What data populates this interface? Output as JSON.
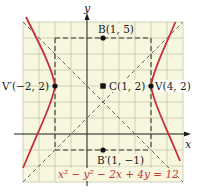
{
  "figure": {
    "equation": "x² − y² − 2x + 4y = 12",
    "axes": {
      "x_label": "x",
      "y_label": "y"
    },
    "grid": {
      "x_range": [
        -4,
        6
      ],
      "y_range": [
        -3,
        7
      ],
      "step": 1
    },
    "points": [
      {
        "name": "B",
        "label": "B(1, 5)",
        "x": 1,
        "y": 5,
        "marker": "dot"
      },
      {
        "name": "C",
        "label": "C(1, 2)",
        "x": 1,
        "y": 2,
        "marker": "square"
      },
      {
        "name": "V",
        "label": "V(4, 2)",
        "x": 4,
        "y": 2,
        "marker": "dot"
      },
      {
        "name": "V'",
        "label": "V′(−2, 2)",
        "x": -2,
        "y": 2,
        "marker": "dot"
      },
      {
        "name": "B'",
        "label": "B′(1, −1)",
        "x": 1,
        "y": -1,
        "marker": "dot"
      }
    ],
    "asymptotes": [
      "y − 2 = x − 1",
      "y − 2 = −(x − 1)"
    ],
    "colors": {
      "grid_bg": "#f7f6df",
      "grid_line": "#c8c9a8",
      "curve": "#c62f3a",
      "dashed": "#555555",
      "axis": "#1a1a1a",
      "equation": "#c0392b"
    }
  }
}
